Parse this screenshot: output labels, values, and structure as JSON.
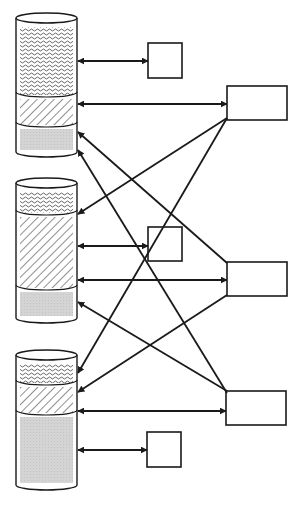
{
  "diagram": {
    "type": "storage-connection-diagram",
    "colors": {
      "stroke": "#1a1a1a",
      "background": "#ffffff",
      "gray_fill": "#d4d4d4",
      "pattern_ink": "#444444"
    },
    "cylinders": [
      {
        "id": "cylinder-1",
        "x": 16,
        "top": 13,
        "bottom": 157,
        "width": 61,
        "segments": [
          {
            "kind": "wavy",
            "y0": 25,
            "y1": 97
          },
          {
            "kind": "hatch",
            "y0": 97,
            "y1": 127
          },
          {
            "kind": "gray",
            "y0": 127,
            "y1": 152
          }
        ]
      },
      {
        "id": "cylinder-2",
        "x": 16,
        "top": 178,
        "bottom": 323,
        "width": 61,
        "segments": [
          {
            "kind": "wavy",
            "y0": 190,
            "y1": 215
          },
          {
            "kind": "hatch",
            "y0": 215,
            "y1": 290
          },
          {
            "kind": "gray",
            "y0": 290,
            "y1": 318
          }
        ]
      },
      {
        "id": "cylinder-3",
        "x": 16,
        "top": 350,
        "bottom": 490,
        "width": 61,
        "segments": [
          {
            "kind": "wavy",
            "y0": 362,
            "y1": 385
          },
          {
            "kind": "hatch",
            "y0": 385,
            "y1": 415
          },
          {
            "kind": "gray",
            "y0": 415,
            "y1": 485
          }
        ]
      }
    ],
    "small_boxes": [
      {
        "id": "small-box-1",
        "x": 148,
        "y": 43,
        "w": 34,
        "h": 35
      },
      {
        "id": "small-box-2",
        "x": 148,
        "y": 227,
        "w": 34,
        "h": 34
      },
      {
        "id": "small-box-3",
        "x": 147,
        "y": 432,
        "w": 34,
        "h": 35
      }
    ],
    "large_boxes": [
      {
        "id": "large-box-1",
        "x": 227,
        "y": 86,
        "w": 60,
        "h": 34
      },
      {
        "id": "large-box-2",
        "x": 227,
        "y": 262,
        "w": 60,
        "h": 34
      },
      {
        "id": "large-box-3",
        "x": 226,
        "y": 391,
        "w": 60,
        "h": 34
      }
    ],
    "connections": [
      {
        "from": [
          148,
          61
        ],
        "to": [
          78,
          61
        ],
        "double": true
      },
      {
        "from": [
          227,
          104
        ],
        "to": [
          78,
          104
        ],
        "double": true
      },
      {
        "from": [
          227,
          263
        ],
        "to": [
          78,
          132
        ],
        "double": false
      },
      {
        "from": [
          227,
          393
        ],
        "to": [
          78,
          150
        ],
        "double": false
      },
      {
        "from": [
          227,
          118
        ],
        "to": [
          78,
          214
        ],
        "double": false
      },
      {
        "from": [
          148,
          246
        ],
        "to": [
          78,
          246
        ],
        "double": true
      },
      {
        "from": [
          227,
          280
        ],
        "to": [
          78,
          280
        ],
        "double": true
      },
      {
        "from": [
          227,
          391
        ],
        "to": [
          78,
          302
        ],
        "double": false
      },
      {
        "from": [
          227,
          118
        ],
        "to": [
          78,
          373
        ],
        "double": false
      },
      {
        "from": [
          227,
          295
        ],
        "to": [
          78,
          392
        ],
        "double": false
      },
      {
        "from": [
          226,
          411
        ],
        "to": [
          78,
          411
        ],
        "double": true
      },
      {
        "from": [
          147,
          450
        ],
        "to": [
          78,
          450
        ],
        "double": true
      }
    ]
  }
}
